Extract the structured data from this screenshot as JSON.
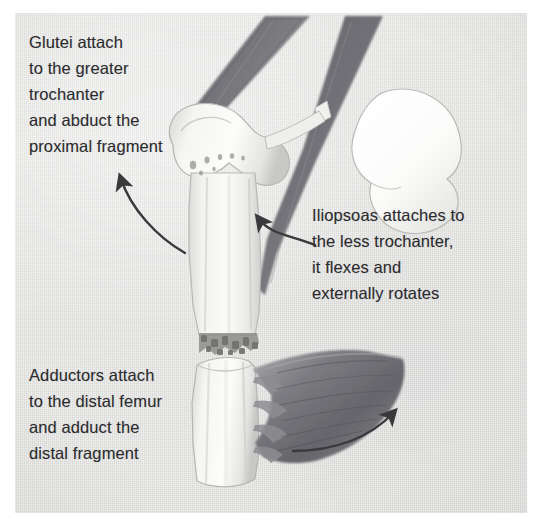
{
  "figure": {
    "kind": "anatomical-illustration",
    "background_color": "#e3e3e1",
    "text_color": "#2b2b2e",
    "bone_color": "#f4f4f2",
    "muscle_color": "#6e6e70",
    "arrow_color": "#3a3a3d"
  },
  "annotations": [
    {
      "id": "glutei",
      "name": "glutei-annotation",
      "text": "Glutei attach\nto the greater\ntrochanter\nand abduct the\nproximal fragment",
      "lines": [
        "Glutei attach",
        "to the greater",
        "trochanter",
        "and abduct the",
        "proximal fragment"
      ]
    },
    {
      "id": "iliopsoas",
      "name": "iliopsoas-annotation",
      "text": "Iliopsoas attaches to\nthe less trochanter,\nit flexes and\nexternally rotates",
      "lines": [
        "Iliopsoas attaches to",
        "the less trochanter,",
        "it flexes and",
        "externally rotates"
      ]
    },
    {
      "id": "adductors",
      "name": "adductors-annotation",
      "text": "Adductors attach\nto the distal femur\nand adduct the\ndistal fragment",
      "lines": [
        "Adductors attach",
        "to the distal femur",
        "and adduct the",
        "distal fragment"
      ]
    }
  ],
  "arrows": [
    {
      "id": "glutei-arrow",
      "name": "glutei-force-arrow",
      "direction": "up-left",
      "points_to": "greater trochanter / proximal fragment"
    },
    {
      "id": "iliopsoas-arrow",
      "name": "iliopsoas-force-arrow",
      "direction": "up-left",
      "points_to": "lesser trochanter"
    },
    {
      "id": "adductors-arrow",
      "name": "adductors-force-arrow",
      "direction": "up-right",
      "points_to": "distal femur adductor mass"
    }
  ],
  "structures": [
    {
      "id": "gluteus-band",
      "name": "gluteus-muscle-band",
      "label": "Gluteal muscle band"
    },
    {
      "id": "iliopsoas-band",
      "name": "iliopsoas-muscle-band",
      "label": "Iliopsoas muscle band"
    },
    {
      "id": "pelvis",
      "name": "pelvis-acetabulum",
      "label": "Pelvis / acetabulum"
    },
    {
      "id": "greater-trochanter",
      "name": "greater-trochanter",
      "label": "Greater trochanter"
    },
    {
      "id": "proximal-fragment",
      "name": "proximal-femur-fragment",
      "label": "Proximal femoral fragment"
    },
    {
      "id": "fracture-site",
      "name": "fracture-site",
      "label": "Comminuted fracture edge"
    },
    {
      "id": "distal-fragment",
      "name": "distal-femur-fragment",
      "label": "Distal femoral fragment"
    },
    {
      "id": "adductor-mass",
      "name": "adductor-muscle-mass",
      "label": "Adductor muscle mass"
    }
  ]
}
